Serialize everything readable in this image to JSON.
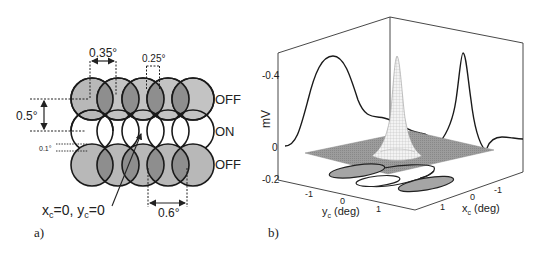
{
  "panel_a": {
    "label": "a)",
    "rows": [
      {
        "label": "OFF",
        "fill": "#b5b5b5",
        "overlap_fill": "#8f8f8f"
      },
      {
        "label": "ON",
        "fill": "#ffffff",
        "overlap_fill": "#ffffff"
      },
      {
        "label": "OFF",
        "fill": "#b5b5b5",
        "overlap_fill": "#8f8f8f"
      }
    ],
    "columns": 5,
    "dimensions": {
      "horizontal_spacing": "0.35°",
      "overlap_width": "0.25°",
      "vertical_spacing": "0.5°",
      "row_gap": "0.1°",
      "bottom_spacing": "0.6°"
    },
    "center_annotation": {
      "x_var": "x",
      "x_sub": "c",
      "x_val": "=0, ",
      "y_var": "y",
      "y_sub": "c",
      "y_val": "=0"
    }
  },
  "panel_b": {
    "label": "b)",
    "z_axis": {
      "label": "mV",
      "ticks": [
        "-0.4",
        "0",
        "-0.2"
      ]
    },
    "y_axis": {
      "label_var": "y",
      "label_sub": "c",
      "label_unit": " (deg)",
      "ticks": [
        "-1",
        "0",
        "1"
      ]
    },
    "x_axis": {
      "label_var": "x",
      "label_sub": "c",
      "label_unit": " (deg)",
      "ticks": [
        "1",
        "0",
        "-1"
      ]
    },
    "surface_fill": "#9a9a9a",
    "contour_fill": "#a0a0a0"
  }
}
